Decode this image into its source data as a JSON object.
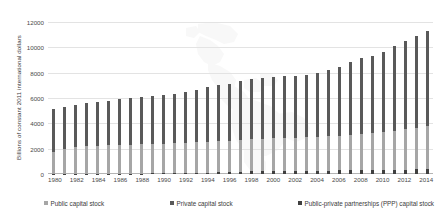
{
  "chart_data": {
    "type": "bar",
    "subtype": "stacked-column",
    "title": "",
    "xlabel": "",
    "ylabel": "Billions of constant 2011 international dollars",
    "ylim": [
      0,
      12000
    ],
    "ytick_labels": [
      "12000",
      "10000",
      "8000",
      "6000",
      "4000",
      "2000",
      "0"
    ],
    "ytick_values": [
      12000,
      10000,
      8000,
      6000,
      4000,
      2000,
      0
    ],
    "grid": true,
    "legend_position": "bottom",
    "background_watermark": "map-of-the-americas",
    "categories": [
      "1980",
      "1981",
      "1982",
      "1983",
      "1984",
      "1985",
      "1986",
      "1987",
      "1988",
      "1989",
      "1990",
      "1991",
      "1992",
      "1993",
      "1994",
      "1995",
      "1996",
      "1997",
      "1998",
      "1999",
      "2000",
      "2001",
      "2002",
      "2003",
      "2004",
      "2005",
      "2006",
      "2007",
      "2008",
      "2009",
      "2010",
      "2011",
      "2012",
      "2013",
      "2014"
    ],
    "xtick_labels": [
      "1980",
      "",
      "1982",
      "",
      "1984",
      "",
      "1986",
      "",
      "1988",
      "",
      "1990",
      "",
      "1992",
      "",
      "1994",
      "",
      "1996",
      "",
      "1998",
      "",
      "2000",
      "",
      "2002",
      "",
      "2004",
      "",
      "2006",
      "",
      "2008",
      "",
      "2010",
      "",
      "2012",
      "",
      "2014"
    ],
    "series": [
      {
        "name": "Public capital stock",
        "color": "#a6a6a6",
        "values": [
          1700,
          1950,
          2100,
          2180,
          2220,
          2250,
          2270,
          2300,
          2320,
          2330,
          2340,
          2350,
          2370,
          2400,
          2430,
          2450,
          2470,
          2500,
          2540,
          2560,
          2580,
          2600,
          2620,
          2640,
          2670,
          2700,
          2740,
          2790,
          2850,
          2920,
          3000,
          3090,
          3190,
          3290,
          3380
        ]
      },
      {
        "name": "Private capital stock",
        "color": "#595959",
        "values": [
          3420,
          3330,
          3320,
          3420,
          3480,
          3520,
          3600,
          3700,
          3750,
          3790,
          3840,
          3910,
          4030,
          4170,
          4320,
          4420,
          4500,
          4640,
          4760,
          4800,
          4850,
          4900,
          4900,
          4930,
          5050,
          5230,
          5460,
          5740,
          6020,
          6080,
          6330,
          6650,
          6960,
          7260,
          7560
        ]
      },
      {
        "name": "Public-private partnerships (PPP) capital stock",
        "color": "#404040",
        "values": [
          10,
          12,
          14,
          16,
          18,
          22,
          26,
          30,
          35,
          42,
          50,
          62,
          78,
          95,
          115,
          135,
          155,
          180,
          205,
          225,
          240,
          250,
          255,
          260,
          265,
          270,
          278,
          288,
          300,
          312,
          325,
          340,
          355,
          370,
          385
        ]
      }
    ]
  },
  "legend": {
    "items": [
      {
        "label": "Public capital stock",
        "color": "#a6a6a6"
      },
      {
        "label": "Private capital stock",
        "color": "#595959"
      },
      {
        "label": "Public-private partnerships (PPP) capital stock",
        "color": "#404040"
      }
    ]
  },
  "axes": {
    "y_title": "Billions of constant 2011 international dollars"
  }
}
